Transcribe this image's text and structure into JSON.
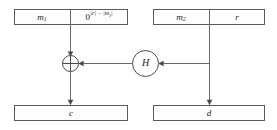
{
  "diagram": {
    "colors": {
      "box_stroke": "#5a5a5a",
      "box_fill": "#fdfdfd",
      "line": "#6a6a6a",
      "node_stroke": "#4a4a4a",
      "text": "#1c1c1c",
      "background": "#ffffff"
    },
    "top_left_box": {
      "name": "message-one-padded-box",
      "cells": [
        {
          "id": "m1",
          "label": "m",
          "subscript": "1"
        },
        {
          "id": "zero-padding",
          "base": "0",
          "superscript": "|c| − |m",
          "superscript_subscript": "1",
          "superscript_tail": "|"
        }
      ]
    },
    "top_right_box": {
      "name": "message-two-random-box",
      "cells": [
        {
          "id": "m2",
          "label": "m",
          "subscript": "2"
        },
        {
          "id": "r",
          "label": "r",
          "subscript": ""
        }
      ]
    },
    "xor_node": {
      "name": "xor-gate",
      "symbol": "⊕",
      "label": ""
    },
    "hash_node": {
      "name": "hash-function-node",
      "label": "H"
    },
    "bottom_left_box": {
      "name": "ciphertext-c-box",
      "label": "c"
    },
    "bottom_right_box": {
      "name": "ciphertext-d-box",
      "label": "d"
    },
    "edges": [
      {
        "id": "m1-pad-to-xor",
        "from": "top_left_box",
        "to": "xor_node",
        "direction": "down"
      },
      {
        "id": "hash-to-xor",
        "from": "hash_node",
        "to": "xor_node",
        "direction": "left"
      },
      {
        "id": "r-to-hash",
        "from": "top_right_box",
        "to": "hash_node",
        "direction": "left"
      },
      {
        "id": "xor-to-c",
        "from": "xor_node",
        "to": "bottom_left_box",
        "direction": "down"
      },
      {
        "id": "r-to-d",
        "from": "top_right_box",
        "to": "bottom_right_box",
        "direction": "down"
      }
    ]
  }
}
